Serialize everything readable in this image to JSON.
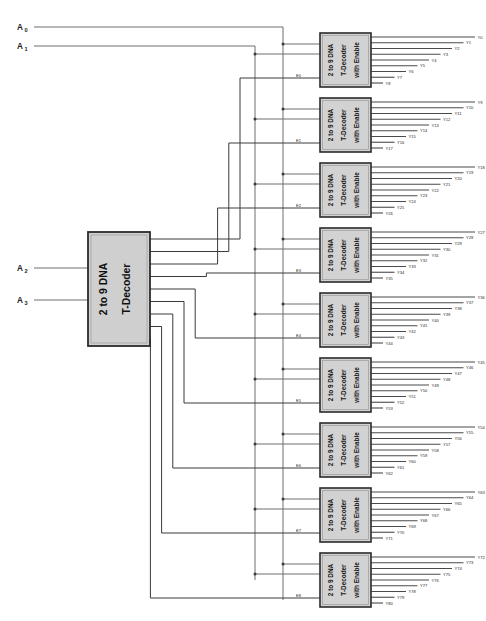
{
  "diagram": {
    "background_color": "#ffffff",
    "block_fill_color": "#d2d2d2",
    "block_border_color": "#2b2b2b",
    "wire_color": "#3a3a3a"
  },
  "inputs": [
    {
      "id": "A0",
      "base": "A",
      "sub": "0",
      "y": 27
    },
    {
      "id": "A1",
      "base": "A",
      "sub": "1",
      "y": 46
    },
    {
      "id": "A2",
      "base": "A",
      "sub": "2",
      "y": 268
    },
    {
      "id": "A3",
      "base": "A",
      "sub": "3",
      "y": 300
    }
  ],
  "main_decoder": {
    "label_line1": "2 to 9 DNA",
    "label_line2": "T-Decoder",
    "x": 88,
    "y": 232,
    "width": 62,
    "height": 114,
    "inputs": [
      "A2",
      "A3"
    ],
    "outputs": [
      "E0",
      "E1",
      "E2",
      "E3",
      "E4",
      "E5",
      "E6",
      "E7",
      "E8"
    ]
  },
  "enable_labels": [
    "E0",
    "E1",
    "E2",
    "E3",
    "E4",
    "E5",
    "E6",
    "E7",
    "E8"
  ],
  "sub_decoders": [
    {
      "index": 0,
      "label_line1": "2 to 9 DNA",
      "label_line2": "T-Decoder",
      "label_line3": "with Enable",
      "enable": "E0",
      "y": 33,
      "outputs": [
        "Y0",
        "Y1",
        "Y2",
        "Y3",
        "Y4",
        "Y5",
        "Y6",
        "Y7",
        "Y8"
      ]
    },
    {
      "index": 1,
      "label_line1": "2 to 9 DNA",
      "label_line2": "T-Decoder",
      "label_line3": "with Enable",
      "enable": "E1",
      "y": 98,
      "outputs": [
        "Y9",
        "Y10",
        "Y11",
        "Y12",
        "Y13",
        "Y14",
        "Y15",
        "Y16",
        "Y17"
      ]
    },
    {
      "index": 2,
      "label_line1": "2 to 9 DNA",
      "label_line2": "T-Decoder",
      "label_line3": "with Enable",
      "enable": "E2",
      "y": 163,
      "outputs": [
        "Y18",
        "Y19",
        "Y20",
        "Y21",
        "Y22",
        "Y23",
        "Y24",
        "Y25",
        "Y26"
      ]
    },
    {
      "index": 3,
      "label_line1": "2 to 9 DNA",
      "label_line2": "T-Decoder",
      "label_line3": "with Enable",
      "enable": "E3",
      "y": 228,
      "outputs": [
        "Y27",
        "Y28",
        "Y29",
        "Y30",
        "Y31",
        "Y32",
        "Y33",
        "Y34",
        "Y35"
      ]
    },
    {
      "index": 4,
      "label_line1": "2 to 9 DNA",
      "label_line2": "T-Decoder",
      "label_line3": "with Enable",
      "enable": "E4",
      "y": 293,
      "outputs": [
        "Y36",
        "Y37",
        "Y38",
        "Y39",
        "Y40",
        "Y41",
        "Y42",
        "Y43",
        "Y44"
      ]
    },
    {
      "index": 5,
      "label_line1": "2 to 9 DNA",
      "label_line2": "T-Decoder",
      "label_line3": "with Enable",
      "enable": "E5",
      "y": 358,
      "outputs": [
        "Y45",
        "Y46",
        "Y47",
        "Y48",
        "Y49",
        "Y50",
        "Y51",
        "Y52",
        "Y53"
      ]
    },
    {
      "index": 6,
      "label_line1": "2 to 9 DNA",
      "label_line2": "T-Decoder",
      "label_line3": "with Enable",
      "enable": "E6",
      "y": 423,
      "outputs": [
        "Y54",
        "Y55",
        "Y56",
        "Y57",
        "Y58",
        "Y59",
        "Y60",
        "Y61",
        "Y62"
      ]
    },
    {
      "index": 7,
      "label_line1": "2 to 9 DNA",
      "label_line2": "T-Decoder",
      "label_line3": "with Enable",
      "enable": "E7",
      "y": 488,
      "outputs": [
        "Y63",
        "Y64",
        "Y65",
        "Y66",
        "Y67",
        "Y68",
        "Y69",
        "Y70",
        "Y71"
      ]
    },
    {
      "index": 8,
      "label_line1": "2 to 9 DNA",
      "label_line2": "T-Decoder",
      "label_line3": "with Enable",
      "enable": "E8",
      "y": 553,
      "outputs": [
        "Y72",
        "Y73",
        "Y74",
        "Y75",
        "Y76",
        "Y77",
        "Y78",
        "Y79",
        "Y80"
      ]
    }
  ]
}
